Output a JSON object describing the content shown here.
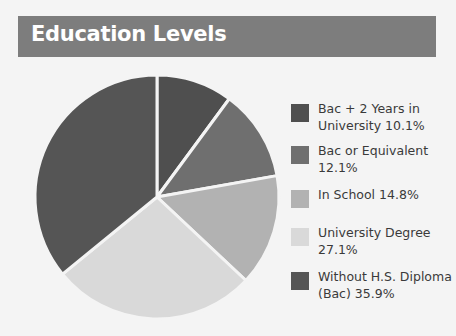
{
  "header": {
    "title": "Education Levels"
  },
  "chart_data": {
    "type": "pie",
    "title": "Education Levels",
    "categories": [
      "Bac + 2 Years in University",
      "Bac or Equivalent",
      "In School",
      "University Degree",
      "Without H.S. Diploma (Bac)"
    ],
    "values": [
      10.1,
      12.1,
      14.8,
      27.1,
      35.9
    ],
    "colors": [
      "#4f4f4f",
      "#6f6f6f",
      "#b2b2b2",
      "#d9d9d9",
      "#555555"
    ],
    "legend_position": "right",
    "start_angle_deg": 0,
    "direction": "clockwise"
  },
  "legend": {
    "items": [
      {
        "label": "Bac + 2 Years in University 10.1%",
        "color": "#4f4f4f"
      },
      {
        "label": "Bac or Equivalent 12.1%",
        "color": "#6f6f6f"
      },
      {
        "label": "In School 14.8%",
        "color": "#b2b2b2"
      },
      {
        "label": "University Degree 27.1%",
        "color": "#d9d9d9"
      },
      {
        "label": "Without H.S. Diploma (Bac) 35.9%",
        "color": "#555555"
      }
    ]
  }
}
